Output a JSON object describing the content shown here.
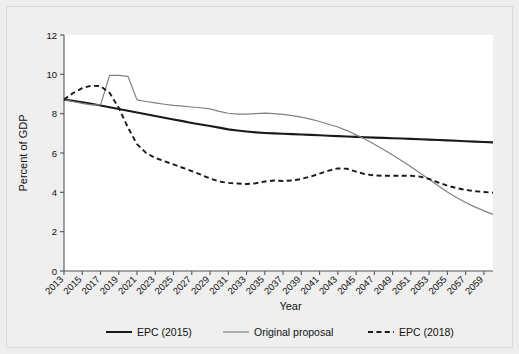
{
  "chart_data": {
    "type": "line",
    "title": "",
    "xlabel": "Year",
    "ylabel": "Percent of GDP",
    "xlim": [
      2013,
      2060
    ],
    "ylim": [
      0,
      12
    ],
    "yticks": [
      0,
      2,
      4,
      6,
      8,
      10,
      12
    ],
    "xticks": [
      2013,
      2015,
      2017,
      2019,
      2021,
      2023,
      2025,
      2027,
      2029,
      2031,
      2033,
      2035,
      2037,
      2039,
      2041,
      2043,
      2045,
      2047,
      2049,
      2051,
      2053,
      2055,
      2057,
      2059
    ],
    "xtick_labels": [
      "2013",
      "2015",
      "2017",
      "2019",
      "2021",
      "2023",
      "2025",
      "2027",
      "2029",
      "2031",
      "2033",
      "2035",
      "2037",
      "2039",
      "2041",
      "2043",
      "2045",
      "2047",
      "2049",
      "2051",
      "2053",
      "2055",
      "2057",
      "2059"
    ],
    "grid": false,
    "legend_position": "bottom",
    "x": [
      2013,
      2014,
      2015,
      2016,
      2017,
      2018,
      2019,
      2020,
      2021,
      2022,
      2023,
      2024,
      2025,
      2026,
      2027,
      2028,
      2029,
      2030,
      2031,
      2032,
      2033,
      2034,
      2035,
      2036,
      2037,
      2038,
      2039,
      2040,
      2041,
      2042,
      2043,
      2044,
      2045,
      2046,
      2047,
      2048,
      2049,
      2050,
      2051,
      2052,
      2053,
      2054,
      2055,
      2056,
      2057,
      2058,
      2059,
      2060
    ],
    "series": [
      {
        "name": "EPC (2015)",
        "color": "#1a1a1a",
        "style": "solid",
        "width": 2.1,
        "values": [
          8.72,
          8.65,
          8.58,
          8.5,
          8.42,
          8.33,
          8.24,
          8.15,
          8.06,
          7.97,
          7.88,
          7.79,
          7.7,
          7.62,
          7.53,
          7.45,
          7.37,
          7.29,
          7.2,
          7.14,
          7.09,
          7.05,
          7.02,
          7.0,
          6.98,
          6.96,
          6.94,
          6.92,
          6.9,
          6.88,
          6.86,
          6.84,
          6.82,
          6.8,
          6.78,
          6.77,
          6.75,
          6.74,
          6.72,
          6.7,
          6.68,
          6.66,
          6.64,
          6.62,
          6.6,
          6.58,
          6.56,
          6.54
        ]
      },
      {
        "name": "Original proposal",
        "color": "#808080",
        "style": "solid",
        "width": 1.2,
        "values": [
          8.72,
          8.62,
          8.52,
          8.45,
          8.45,
          9.95,
          9.95,
          9.9,
          8.7,
          8.62,
          8.55,
          8.48,
          8.42,
          8.38,
          8.34,
          8.3,
          8.24,
          8.12,
          8.02,
          7.98,
          7.98,
          8.0,
          8.03,
          8.0,
          7.96,
          7.9,
          7.82,
          7.72,
          7.6,
          7.46,
          7.32,
          7.14,
          6.92,
          6.7,
          6.44,
          6.18,
          5.9,
          5.6,
          5.3,
          4.98,
          4.66,
          4.34,
          4.02,
          3.74,
          3.48,
          3.26,
          3.06,
          2.88
        ]
      },
      {
        "name": "EPC (2018)",
        "color": "#1a1a1a",
        "style": "dashed",
        "width": 1.9,
        "values": [
          8.72,
          9.05,
          9.3,
          9.42,
          9.4,
          9.05,
          8.3,
          7.3,
          6.45,
          6.0,
          5.75,
          5.58,
          5.42,
          5.25,
          5.08,
          4.9,
          4.7,
          4.55,
          4.48,
          4.45,
          4.42,
          4.46,
          4.55,
          4.6,
          4.58,
          4.6,
          4.68,
          4.8,
          4.95,
          5.1,
          5.22,
          5.2,
          5.05,
          4.92,
          4.86,
          4.84,
          4.84,
          4.84,
          4.84,
          4.8,
          4.68,
          4.5,
          4.34,
          4.22,
          4.12,
          4.06,
          4.02,
          3.98
        ]
      }
    ]
  },
  "legend": {
    "items": [
      {
        "label": "EPC (2015)",
        "style": "solid",
        "color": "#1a1a1a"
      },
      {
        "label": "Original proposal",
        "style": "solid",
        "color": "#808080"
      },
      {
        "label": "EPC (2018)",
        "style": "dashed",
        "color": "#1a1a1a"
      }
    ]
  }
}
